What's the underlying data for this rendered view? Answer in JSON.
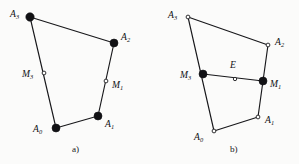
{
  "figure": {
    "background_color": "#fbfbfa",
    "ink_color": "#17171a",
    "panels": [
      {
        "id": "panel-a",
        "caption": "a)",
        "caption_pos": {
          "x": 72,
          "y": 152
        },
        "points": [
          {
            "name": "A0",
            "label": "A",
            "sub": "0",
            "x": 56,
            "y": 128,
            "style": "filled",
            "r": 4.0,
            "label_x": 33,
            "label_y": 132
          },
          {
            "name": "A1",
            "label": "A",
            "sub": "1",
            "x": 98,
            "y": 116,
            "style": "filled",
            "r": 4.0,
            "label_x": 105,
            "label_y": 127
          },
          {
            "name": "A2",
            "label": "A",
            "sub": "2",
            "x": 114,
            "y": 43,
            "style": "filled",
            "r": 4.0,
            "label_x": 121,
            "label_y": 40
          },
          {
            "name": "A3",
            "label": "A",
            "sub": "3",
            "x": 30,
            "y": 17,
            "style": "filled",
            "r": 4.2,
            "label_x": 10,
            "label_y": 17
          },
          {
            "name": "M3",
            "label": "M",
            "sub": "3",
            "x": 44,
            "y": 73,
            "style": "open",
            "r": 1.9,
            "label_x": 22,
            "label_y": 77
          },
          {
            "name": "M1",
            "label": "M",
            "sub": "1",
            "x": 106,
            "y": 81,
            "style": "open",
            "r": 1.9,
            "label_x": 112,
            "label_y": 88
          }
        ],
        "edges": [
          {
            "from": "A0",
            "to": "A1"
          },
          {
            "from": "A1",
            "to": "A2"
          },
          {
            "from": "A2",
            "to": "A3"
          },
          {
            "from": "A3",
            "to": "A0"
          }
        ],
        "chords": []
      },
      {
        "id": "panel-b",
        "caption": "b)",
        "caption_pos": {
          "x": 230,
          "y": 152
        },
        "points": [
          {
            "name": "A0",
            "label": "A",
            "sub": "0",
            "x": 214,
            "y": 131,
            "style": "open",
            "r": 1.9,
            "label_x": 194,
            "label_y": 140
          },
          {
            "name": "A1",
            "label": "A",
            "sub": "1",
            "x": 258,
            "y": 117,
            "style": "open",
            "r": 1.9,
            "label_x": 265,
            "label_y": 123
          },
          {
            "name": "A2",
            "label": "A",
            "sub": "2",
            "x": 268,
            "y": 45,
            "style": "open",
            "r": 1.9,
            "label_x": 275,
            "label_y": 45
          },
          {
            "name": "A3",
            "label": "A",
            "sub": "3",
            "x": 188,
            "y": 17,
            "style": "open",
            "r": 1.9,
            "label_x": 168,
            "label_y": 18
          },
          {
            "name": "M3",
            "label": "M",
            "sub": "3",
            "x": 203,
            "y": 74,
            "style": "filled",
            "r": 4.0,
            "label_x": 180,
            "label_y": 78
          },
          {
            "name": "M1",
            "label": "M",
            "sub": "1",
            "x": 263,
            "y": 81,
            "style": "filled",
            "r": 4.0,
            "label_x": 270,
            "label_y": 87
          },
          {
            "name": "E",
            "label": "E",
            "sub": "",
            "x": 235,
            "y": 79,
            "style": "open",
            "r": 1.7,
            "label_x": 230,
            "label_y": 68
          }
        ],
        "edges": [
          {
            "from": "A0",
            "to": "A1"
          },
          {
            "from": "A1",
            "to": "A2"
          },
          {
            "from": "A2",
            "to": "A3"
          },
          {
            "from": "A3",
            "to": "A0"
          }
        ],
        "chords": [
          {
            "from": "M3",
            "to": "M1"
          }
        ]
      }
    ]
  },
  "chart_data": {
    "type": "diagram",
    "title": "",
    "panels": [
      "a)",
      "b)"
    ],
    "labels": [
      "A0",
      "A1",
      "A2",
      "A3",
      "M1",
      "M3",
      "E"
    ]
  }
}
